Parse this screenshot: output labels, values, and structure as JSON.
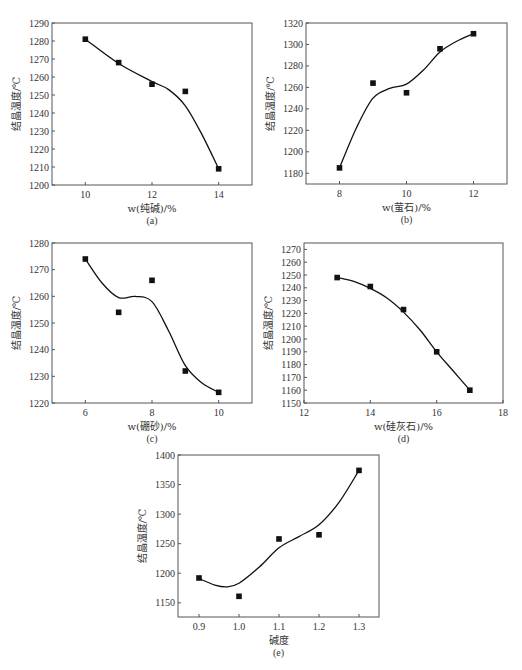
{
  "chart_data": [
    {
      "id": "a",
      "type": "scatter",
      "panel_label": "(a)",
      "xlabel": "w(纯碱)/%",
      "ylabel": "结晶温度/℃",
      "xlim": [
        9,
        15
      ],
      "ylim": [
        1200,
        1290
      ],
      "xticks": [
        10,
        12,
        14
      ],
      "yticks": [
        1200,
        1210,
        1220,
        1230,
        1240,
        1250,
        1260,
        1270,
        1280,
        1290
      ],
      "grid": false,
      "legend": null,
      "series": [
        {
          "name": "data",
          "x": [
            10,
            11,
            12,
            13,
            14
          ],
          "y": [
            1281,
            1268,
            1256,
            1252,
            1209
          ],
          "marker": "square",
          "fit_curve": true
        }
      ],
      "curve": [
        [
          10,
          1281
        ],
        [
          11,
          1267.5
        ],
        [
          12,
          1257.5
        ],
        [
          12.5,
          1253
        ],
        [
          13,
          1244
        ],
        [
          13.5,
          1228
        ],
        [
          14,
          1209
        ]
      ],
      "box": {
        "left": 52,
        "top": 23,
        "right": 252,
        "bottom": 185
      }
    },
    {
      "id": "b",
      "type": "scatter",
      "panel_label": "(b)",
      "xlabel": "w(萤石)/%",
      "ylabel": "结晶温度/℃",
      "xlim": [
        7,
        13
      ],
      "ylim": [
        1170,
        1320
      ],
      "xticks": [
        8,
        10,
        12
      ],
      "yticks": [
        1180,
        1200,
        1220,
        1240,
        1260,
        1280,
        1300,
        1320
      ],
      "grid": false,
      "legend": null,
      "series": [
        {
          "name": "data",
          "x": [
            8,
            9,
            10,
            11,
            12
          ],
          "y": [
            1185,
            1264,
            1255,
            1296,
            1310
          ],
          "marker": "square",
          "fit_curve": true
        }
      ],
      "curve": [
        [
          8,
          1185
        ],
        [
          8.5,
          1222
        ],
        [
          9,
          1250
        ],
        [
          9.5,
          1259
        ],
        [
          10,
          1263
        ],
        [
          10.5,
          1276
        ],
        [
          11,
          1293
        ],
        [
          11.5,
          1303
        ],
        [
          12,
          1310
        ]
      ],
      "box": {
        "left": 306,
        "top": 23,
        "right": 507,
        "bottom": 184
      }
    },
    {
      "id": "c",
      "type": "scatter",
      "panel_label": "(c)",
      "xlabel": "w(硼砂)/%",
      "ylabel": "结晶温度/℃",
      "xlim": [
        5,
        11
      ],
      "ylim": [
        1220,
        1280
      ],
      "xticks": [
        6,
        8,
        10
      ],
      "yticks": [
        1220,
        1230,
        1240,
        1250,
        1260,
        1270,
        1280
      ],
      "grid": false,
      "legend": null,
      "series": [
        {
          "name": "data",
          "x": [
            6,
            7,
            8,
            9,
            10
          ],
          "y": [
            1274,
            1254,
            1266,
            1232,
            1224
          ],
          "marker": "square",
          "fit_curve": true
        }
      ],
      "curve": [
        [
          6,
          1274
        ],
        [
          6.5,
          1265
        ],
        [
          7,
          1259.5
        ],
        [
          7.5,
          1260
        ],
        [
          8,
          1258
        ],
        [
          8.5,
          1247
        ],
        [
          9,
          1234
        ],
        [
          9.5,
          1227.5
        ],
        [
          10,
          1224
        ]
      ],
      "box": {
        "left": 52,
        "top": 243,
        "right": 252,
        "bottom": 403
      }
    },
    {
      "id": "d",
      "type": "scatter",
      "panel_label": "(d)",
      "xlabel": "w(硅灰石)/%",
      "ylabel": "结晶温度/℃",
      "xlim": [
        12,
        18
      ],
      "ylim": [
        1150,
        1275
      ],
      "xticks": [
        12,
        14,
        16,
        18
      ],
      "yticks": [
        1150,
        1160,
        1170,
        1180,
        1190,
        1200,
        1210,
        1220,
        1230,
        1240,
        1250,
        1260,
        1270
      ],
      "grid": false,
      "legend": null,
      "series": [
        {
          "name": "data",
          "x": [
            13,
            14,
            15,
            16,
            17
          ],
          "y": [
            1248,
            1241,
            1223,
            1190,
            1160
          ],
          "marker": "square",
          "fit_curve": true
        }
      ],
      "curve": [
        [
          13,
          1248
        ],
        [
          13.5,
          1245
        ],
        [
          14,
          1239.5
        ],
        [
          14.5,
          1232
        ],
        [
          15,
          1221
        ],
        [
          15.5,
          1207
        ],
        [
          16,
          1190
        ],
        [
          16.5,
          1175
        ],
        [
          17,
          1160
        ]
      ],
      "box": {
        "left": 304,
        "top": 243,
        "right": 503,
        "bottom": 403
      }
    },
    {
      "id": "e",
      "type": "scatter",
      "panel_label": "(e)",
      "xlabel": "碱度",
      "ylabel": "结晶温度/℃",
      "xlim": [
        0.8475,
        1.35
      ],
      "ylim": [
        1126,
        1400
      ],
      "xticks": [
        0.9,
        1.0,
        1.1,
        1.2,
        1.3
      ],
      "xtick_labels": [
        "0.9",
        "1.0",
        "1.1",
        "1.2",
        "1.3"
      ],
      "yticks": [
        1150,
        1200,
        1250,
        1300,
        1350,
        1400
      ],
      "grid": false,
      "legend": null,
      "series": [
        {
          "name": "data",
          "x": [
            0.9,
            1.0,
            1.1,
            1.2,
            1.3
          ],
          "y": [
            1192,
            1161,
            1258,
            1265,
            1374
          ],
          "marker": "square",
          "fit_curve": true
        }
      ],
      "curve": [
        [
          0.9,
          1191
        ],
        [
          0.94,
          1180
        ],
        [
          0.97,
          1177
        ],
        [
          1.0,
          1183
        ],
        [
          1.05,
          1210
        ],
        [
          1.1,
          1243
        ],
        [
          1.15,
          1262
        ],
        [
          1.2,
          1282
        ],
        [
          1.25,
          1320
        ],
        [
          1.3,
          1374
        ]
      ],
      "box": {
        "left": 178,
        "top": 455,
        "right": 379,
        "bottom": 617
      }
    }
  ]
}
